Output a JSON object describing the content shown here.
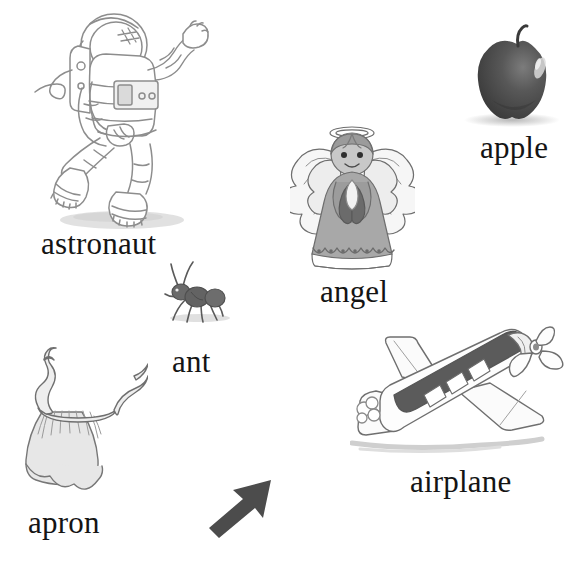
{
  "page": {
    "background_color": "#ffffff",
    "width": 577,
    "height": 574,
    "style": "grayscale hand-drawn illustrations with serif captions"
  },
  "items": [
    {
      "id": "astronaut",
      "label": "astronaut",
      "illustration": "astronaut-drawing",
      "description": "pencil line drawing of an astronaut in a spacesuit with helmet, backpack and tether, one arm raised, legs bent as if floating, soft grey shadow beneath",
      "colors": {
        "outline": "#8d8d8d",
        "fill": "#ffffff",
        "shadow": "#d6d6d6"
      }
    },
    {
      "id": "angel",
      "label": "angel",
      "illustration": "angel-drawing",
      "description": "grey figurine angel with halo, feathered wings, hands pressed together in prayer and a long scalloped robe",
      "colors": {
        "outline": "#6e6e6e",
        "robe": "#a8a8a8",
        "wings": "#f2f2f2",
        "shadow": "#6b6b6b"
      }
    },
    {
      "id": "apple",
      "label": "apple",
      "illustration": "apple-photo",
      "description": "dark grey apple with short stem and a bright highlight on its upper right, resting on a faint shadow",
      "colors": {
        "body": "#4a4a4a",
        "highlight": "#d9d9d9",
        "stem": "#3a3a3a",
        "shadow": "#cfcfcf"
      }
    },
    {
      "id": "ant",
      "label": "ant",
      "illustration": "ant-drawing",
      "description": "small dark grey ant in side view with two long curved antennae and six thin legs, facing left",
      "colors": {
        "body": "#555555",
        "legs": "#666666",
        "shadow": "#dadada"
      }
    },
    {
      "id": "apron",
      "label": "apron",
      "illustration": "apron-drawing",
      "description": "light grey gathered apron with a wide skirt and two wavy neck and waist ties curling upward",
      "colors": {
        "outline": "#777777",
        "fill": "#e7e7e7",
        "gathers": "#9a9a9a"
      }
    },
    {
      "id": "airplane",
      "label": "airplane",
      "illustration": "airplane-drawing",
      "description": "single propeller airplane drawn in perspective flying up to the right, dark shaded fuselage top, cockpit windows, two wings, tail fin and a small puff of smoke at the rear",
      "colors": {
        "outline": "#6f6f6f",
        "fuselage_shade": "#5b5b5b",
        "fill": "#fbfbfb",
        "shadow": "#d2d2d2"
      }
    }
  ],
  "decorations": [
    {
      "id": "arrow",
      "name": "arrow-pointing-up-right",
      "description": "solid dark grey bent arrow pointing toward the upper right",
      "color": "#4c4c4c",
      "direction": "up-right"
    }
  ]
}
